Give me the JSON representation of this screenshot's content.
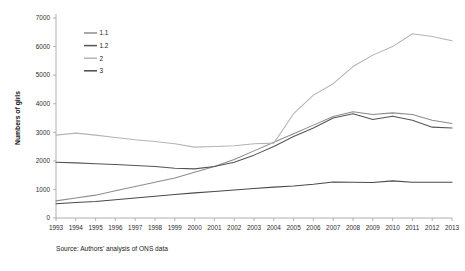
{
  "figure": {
    "source_note": "Source: Authors' analysis of ONS data"
  },
  "chart_data": {
    "type": "line",
    "title": "",
    "subtitle": "",
    "xlabel": "",
    "ylabel": "Numbers of girls",
    "xlim": [
      1993,
      2013
    ],
    "ylim": [
      0,
      7000
    ],
    "yticks": [
      0,
      1000,
      2000,
      3000,
      4000,
      5000,
      6000,
      7000
    ],
    "ytick_labels": [
      "0",
      "1000",
      "2000",
      "3000",
      "4000",
      "5000",
      "6000",
      "7000"
    ],
    "grid": false,
    "legend_position": "top-left-inside",
    "x": [
      1993,
      1994,
      1995,
      1996,
      1997,
      1998,
      1999,
      2000,
      2001,
      2002,
      2003,
      2004,
      2005,
      2006,
      2007,
      2008,
      2009,
      2010,
      2011,
      2012,
      2013
    ],
    "categories": [
      "1993",
      "1994",
      "1995",
      "1996",
      "1997",
      "1998",
      "1999",
      "2000",
      "2001",
      "2002",
      "2003",
      "2004",
      "2005",
      "2006",
      "2007",
      "2008",
      "2009",
      "2010",
      "2011",
      "2012",
      "2013"
    ],
    "xtick_labels": [
      "1993",
      "1994",
      "1995",
      "1996",
      "1997",
      "1998",
      "1999",
      "2000",
      "2001",
      "2002",
      "2003",
      "2004",
      "2005",
      "2006",
      "2007",
      "2008",
      "2009",
      "2010",
      "2011",
      "2012",
      "2013"
    ],
    "series": [
      {
        "name": "1.1",
        "color": "#8c8c8c",
        "values": [
          600,
          700,
          800,
          950,
          1100,
          1250,
          1400,
          1600,
          1800,
          2050,
          2350,
          2650,
          2950,
          3250,
          3550,
          3720,
          3620,
          3680,
          3620,
          3420,
          3310
        ]
      },
      {
        "name": "1.2",
        "color": "#555555",
        "values": [
          1950,
          1930,
          1900,
          1870,
          1840,
          1800,
          1740,
          1720,
          1800,
          1950,
          2200,
          2500,
          2850,
          3150,
          3500,
          3650,
          3450,
          3560,
          3420,
          3180,
          3150
        ]
      },
      {
        "name": "2",
        "color": "#b4b4b4",
        "values": [
          2900,
          2970,
          2900,
          2820,
          2740,
          2680,
          2600,
          2480,
          2500,
          2530,
          2600,
          2620,
          3650,
          4300,
          4700,
          5300,
          5700,
          6000,
          6450,
          6350,
          6200
        ]
      },
      {
        "name": "3",
        "color": "#4a4a4a",
        "values": [
          500,
          540,
          580,
          640,
          700,
          760,
          820,
          880,
          930,
          980,
          1030,
          1080,
          1120,
          1180,
          1260,
          1250,
          1240,
          1300,
          1250,
          1250,
          1250
        ]
      }
    ],
    "legend": [
      {
        "label": "1.1",
        "color": "#8c8c8c"
      },
      {
        "label": "1.2",
        "color": "#555555"
      },
      {
        "label": "2",
        "color": "#b4b4b4"
      },
      {
        "label": "3",
        "color": "#4a4a4a"
      }
    ]
  }
}
